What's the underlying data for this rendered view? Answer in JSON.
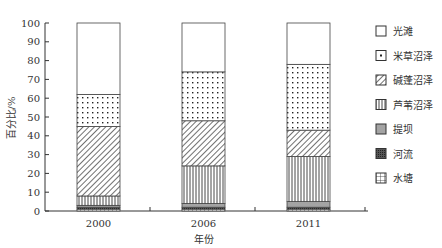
{
  "chart_data": {
    "type": "bar",
    "stacked": true,
    "title": "",
    "xlabel": "年份",
    "ylabel": "百分比/%",
    "ylim": [
      0,
      100
    ],
    "yticks": [
      0,
      10,
      20,
      30,
      40,
      50,
      60,
      70,
      80,
      90,
      100
    ],
    "grid": false,
    "legend_position": "right",
    "categories": [
      "2000",
      "2006",
      "2011"
    ],
    "series": [
      {
        "name": "水塘",
        "pattern": "grid",
        "values": [
          1,
          1,
          1
        ]
      },
      {
        "name": "河流",
        "pattern": "dense-cross",
        "values": [
          1,
          1,
          1
        ]
      },
      {
        "name": "提坝",
        "pattern": "horizontal-lines",
        "values": [
          1,
          2,
          3
        ]
      },
      {
        "name": "芦苇沼泽",
        "pattern": "vertical-lines",
        "values": [
          5,
          20,
          24
        ]
      },
      {
        "name": "碱蓬沼泽",
        "pattern": "diagonal-lines",
        "values": [
          37,
          24,
          14
        ]
      },
      {
        "name": "米草沼泽",
        "pattern": "dots",
        "values": [
          17,
          26,
          35
        ]
      },
      {
        "name": "光滩",
        "pattern": "blank",
        "values": [
          38,
          26,
          22
        ]
      }
    ]
  },
  "legend": [
    {
      "label": "光滩",
      "pattern": "blank"
    },
    {
      "label": "米草沼泽",
      "pattern": "dot-center"
    },
    {
      "label": "碱蓬沼泽",
      "pattern": "diagonal-lines"
    },
    {
      "label": "芦苇沼泽",
      "pattern": "vertical-lines"
    },
    {
      "label": "提坝",
      "pattern": "horizontal-lines"
    },
    {
      "label": "河流",
      "pattern": "dense-cross"
    },
    {
      "label": "水塘",
      "pattern": "grid"
    }
  ],
  "colors": {
    "stroke": "#333333",
    "background": "#ffffff",
    "text": "#333333"
  }
}
